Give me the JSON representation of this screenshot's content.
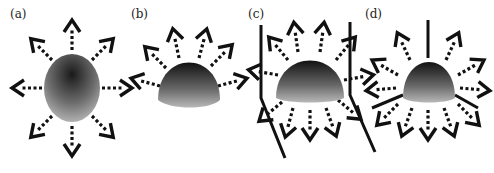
{
  "figure": {
    "panels": [
      {
        "id": "a",
        "label": "(a)",
        "shape": "sphere",
        "walls": 0,
        "arrow_count": 8
      },
      {
        "id": "b",
        "label": "(b)",
        "shape": "hemisphere",
        "walls": 0,
        "arrow_count": 6
      },
      {
        "id": "c",
        "label": "(c)",
        "shape": "hemisphere",
        "walls": 2,
        "arrow_count": 11
      },
      {
        "id": "d",
        "label": "(d)",
        "shape": "hemisphere",
        "walls": 2,
        "arrow_count": 11
      }
    ],
    "colors": {
      "arrow": "#111111",
      "sphere_dark": "#1a1a1a",
      "sphere_light": "#bdbdbd",
      "background": "#ffffff"
    }
  }
}
